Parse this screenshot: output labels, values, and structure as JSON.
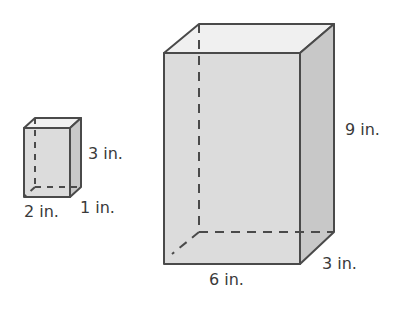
{
  "figure": {
    "colors": {
      "edge": "#4a4a4a",
      "front_face": "#dcdcdc",
      "top_face": "#f0f0f0",
      "side_face": "#c8c8c8",
      "text": "#3a3a3a"
    },
    "small_prism": {
      "length_label": "2 in.",
      "width_label": "1 in.",
      "height_label": "3 in."
    },
    "large_prism": {
      "length_label": "6 in.",
      "width_label": "3 in.",
      "height_label": "9 in."
    }
  }
}
